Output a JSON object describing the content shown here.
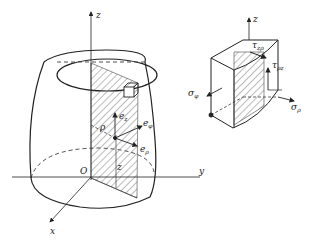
{
  "diagram": {
    "left_figure": {
      "axes": {
        "z": "z",
        "y": "y",
        "x": "x",
        "origin": "O"
      },
      "vectors": {
        "e_z": "e",
        "e_z_sub": "z",
        "e_phi": "e",
        "e_phi_sub": "φ",
        "e_rho": "e",
        "e_rho_sub": "ρ"
      },
      "labels": {
        "rho": "ρ",
        "z_height": "z"
      }
    },
    "right_figure": {
      "axis_z": "z",
      "stresses": {
        "tau_zp": "τ",
        "tau_zp_sub": "zρ",
        "tau_pz": "τ",
        "tau_pz_sub": "ρz",
        "sigma_phi": "σ",
        "sigma_phi_sub": "φ",
        "sigma_rho": "σ",
        "sigma_rho_sub": "ρ"
      }
    },
    "colors": {
      "line": "#222222",
      "hatch": "#555555"
    }
  }
}
